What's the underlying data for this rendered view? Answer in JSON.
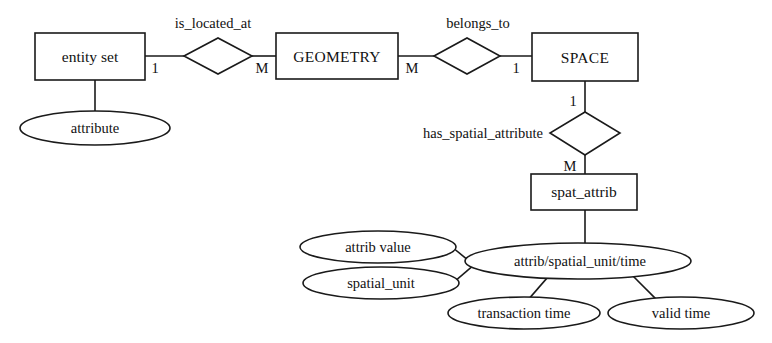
{
  "diagram": {
    "type": "er-diagram",
    "colors": {
      "background": "#ffffff",
      "stroke": "#1a1a1a",
      "text": "#111111"
    }
  },
  "entities": [
    {
      "id": "entity_set",
      "label": "entity set",
      "shape": "rectangle",
      "kind": "generic-entity"
    },
    {
      "id": "geometry",
      "label": "GEOMETRY",
      "shape": "rectangle",
      "kind": "entity"
    },
    {
      "id": "space",
      "label": "SPACE",
      "shape": "rectangle",
      "kind": "entity"
    },
    {
      "id": "spat_attrib",
      "label": "spat_attrib",
      "shape": "rectangle",
      "kind": "entity"
    }
  ],
  "relationships": [
    {
      "id": "is_located_at",
      "label": "is_located_at",
      "shape": "diamond",
      "from": "entity_set",
      "to": "geometry",
      "from_card": "1",
      "to_card": "M"
    },
    {
      "id": "belongs_to",
      "label": "belongs_to",
      "shape": "diamond",
      "from": "geometry",
      "to": "space",
      "from_card": "M",
      "to_card": "1"
    },
    {
      "id": "has_spatial_attribute",
      "label": "has_spatial_attribute",
      "shape": "diamond",
      "from": "space",
      "to": "spat_attrib",
      "from_card": "1",
      "to_card": "M"
    }
  ],
  "attributes": [
    {
      "id": "attribute",
      "label": "attribute",
      "shape": "ellipse",
      "owner": "entity_set"
    },
    {
      "id": "attrib_spatial_unit_time",
      "label": "attrib/spatial_unit/time",
      "shape": "ellipse",
      "owner": "spat_attrib"
    },
    {
      "id": "attrib_value",
      "label": "attrib value",
      "shape": "ellipse",
      "owner": "attrib_spatial_unit_time"
    },
    {
      "id": "spatial_unit",
      "label": "spatial_unit",
      "shape": "ellipse",
      "owner": "attrib_spatial_unit_time"
    },
    {
      "id": "transaction_time",
      "label": "transaction time",
      "shape": "ellipse",
      "owner": "attrib_spatial_unit_time"
    },
    {
      "id": "valid_time",
      "label": "valid time",
      "shape": "ellipse",
      "owner": "attrib_spatial_unit_time"
    }
  ],
  "cardinality_labels": {
    "entity_set_to_is_located_at": "1",
    "is_located_at_to_geometry": "M",
    "geometry_to_belongs_to": "M",
    "belongs_to_to_space": "1",
    "space_to_has_spatial_attribute": "1",
    "has_spatial_attribute_to_spat_attrib": "M"
  }
}
